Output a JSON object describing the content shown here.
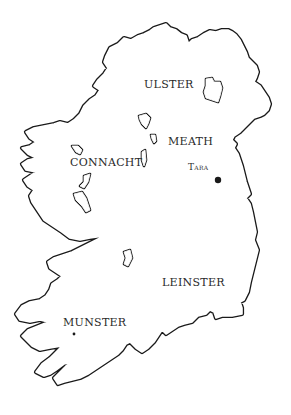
{
  "map": {
    "title": "Provinces of Ireland",
    "provinces": [
      {
        "name": "ULSTER",
        "x": 144,
        "y": 80
      },
      {
        "name": "MEATH",
        "x": 168,
        "y": 137
      },
      {
        "name": "CONNACHT",
        "x": 70,
        "y": 157
      },
      {
        "name": "LEINSTER",
        "x": 162,
        "y": 277
      },
      {
        "name": "MUNSTER",
        "x": 63,
        "y": 317
      }
    ],
    "places": [
      {
        "name": "Tara",
        "label": "Tara",
        "x": 188,
        "y": 163,
        "dot_x": 218,
        "dot_y": 180
      }
    ],
    "colors": {
      "outline": "#1a1a1a",
      "background": "#ffffff",
      "text": "#2a2a2a"
    }
  }
}
